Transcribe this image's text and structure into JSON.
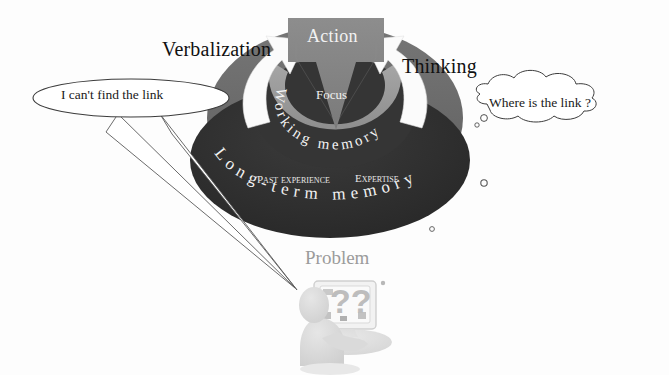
{
  "diagram": {
    "background_color": "#fdfdfd"
  },
  "labels": {
    "verbalization": "Verbalization",
    "thinking": "Thinking",
    "action": "Action",
    "focus": "Focus",
    "working_memory": "Working memory",
    "long_term_memory": "Long-term memory",
    "past_experience": "Past experience",
    "expertise": "Expertise",
    "problem": "Problem"
  },
  "bubbles": {
    "speech": {
      "text": "I can't find the link",
      "shape": "ellipse-speech-balloon"
    },
    "thought": {
      "text": "Where is the link ?",
      "shape": "cloud-thought-balloon",
      "trail_dots": 2
    }
  },
  "figure": {
    "monitor_text": "??",
    "caption": "Problem"
  },
  "colors": {
    "outer_ellipse": "#2f2f2f",
    "mid_ring": "#6b6b6b",
    "inner_ring": "#9a9a9a",
    "action_arrow": "#848484",
    "inner_disc": "#3a3a3a",
    "white_arrow": "#fbfbfb",
    "text_dark": "#111111",
    "text_light": "#f0f0f0",
    "problem_gray": "#9b9b9b",
    "figure_gray": "#d8d8d8",
    "outline": "#4a4a4a"
  },
  "arc_text": {
    "working_memory_chars": [
      "W",
      "o",
      "r",
      "k",
      "i",
      "n",
      "g",
      " ",
      "m",
      "e",
      "m",
      "o",
      "r",
      "y"
    ],
    "long_term_memory_chars": [
      "L",
      "o",
      "n",
      "g",
      "-",
      "t",
      "e",
      "r",
      "m",
      " ",
      "m",
      "e",
      "m",
      "o",
      "r",
      "y"
    ]
  }
}
